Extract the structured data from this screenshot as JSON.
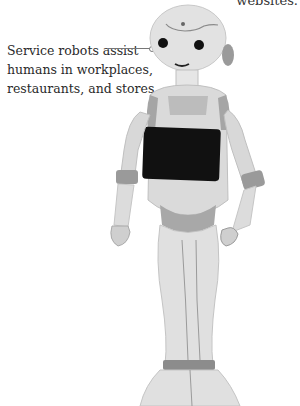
{
  "header": {
    "cut_text": "websites."
  },
  "figure": {
    "caption_lines": [
      "Service robots assist",
      "humans in workplaces,",
      "restaurants, and stores."
    ],
    "image_subject": "humanoid-service-robot",
    "colors": {
      "body": "#dcdcdc",
      "accent": "#9a9a9a",
      "screen": "#111111"
    }
  }
}
